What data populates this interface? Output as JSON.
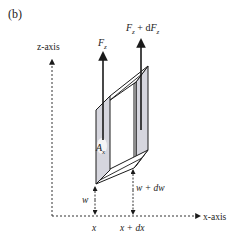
{
  "figure": {
    "panel_label": "(b)",
    "axes": {
      "z_label": "z-axis",
      "x_label": "x-axis"
    },
    "forces": {
      "left": {
        "symbol": "F",
        "subscript": "z"
      },
      "right": {
        "symbol": "F",
        "subscript": "z",
        "plus": " + d",
        "symbol2": "F",
        "subscript2": "z"
      }
    },
    "area": {
      "symbol": "A",
      "subscript": "x"
    },
    "heights": {
      "left": "w",
      "right": "w + dw"
    },
    "positions": {
      "left": "x",
      "right": "x + dx"
    },
    "colors": {
      "stroke": "#1a1a1a",
      "face_fill": "#d6d6de",
      "face_light": "#eeeef2",
      "dash": "#333333"
    }
  }
}
